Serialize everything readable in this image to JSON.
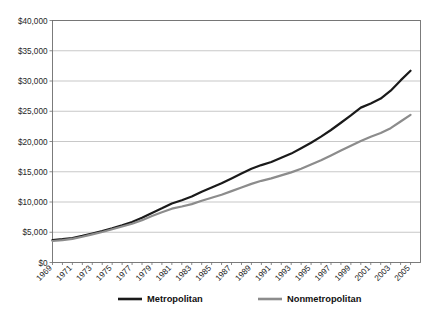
{
  "chart_data": {
    "type": "line",
    "title": "",
    "xlabel": "",
    "ylabel": "",
    "grid": true,
    "legend_position": "bottom",
    "ylim": [
      0,
      40000
    ],
    "yticks": [
      0,
      5000,
      10000,
      15000,
      20000,
      25000,
      30000,
      35000,
      40000
    ],
    "ytick_labels": [
      "$0",
      "$5,000",
      "$10,000",
      "$15,000",
      "$20,000",
      "$25,000",
      "$30,000",
      "$35,000",
      "$40,000"
    ],
    "xlim": [
      1969,
      2006
    ],
    "x": [
      1969,
      1970,
      1971,
      1972,
      1973,
      1974,
      1975,
      1976,
      1977,
      1978,
      1979,
      1980,
      1981,
      1982,
      1983,
      1984,
      1985,
      1986,
      1987,
      1988,
      1989,
      1990,
      1991,
      1992,
      1993,
      1994,
      1995,
      1996,
      1997,
      1998,
      1999,
      2000,
      2001,
      2002,
      2003,
      2004,
      2005
    ],
    "xtick_labels": [
      "1969",
      "1971",
      "1973",
      "1975",
      "1977",
      "1979",
      "1981",
      "1983",
      "1985",
      "1987",
      "1989",
      "1991",
      "1993",
      "1995",
      "1997",
      "1999",
      "2001",
      "2003",
      "2005"
    ],
    "series": [
      {
        "name": "Metropolitan",
        "color": "#1a1a1a",
        "values": [
          3700,
          3850,
          4050,
          4400,
          4800,
          5200,
          5650,
          6150,
          6700,
          7400,
          8200,
          8950,
          9750,
          10300,
          10900,
          11700,
          12400,
          13100,
          13900,
          14700,
          15500,
          16100,
          16600,
          17300,
          18000,
          18900,
          19800,
          20800,
          21900,
          23100,
          24300,
          25600,
          26300,
          27100,
          28400,
          30100,
          31700
        ]
      },
      {
        "name": "Nonmetropolitan",
        "color": "#8c8c8c",
        "values": [
          3550,
          3700,
          3900,
          4250,
          4650,
          5050,
          5500,
          5950,
          6400,
          7000,
          7700,
          8300,
          8900,
          9250,
          9650,
          10200,
          10700,
          11200,
          11800,
          12400,
          13000,
          13500,
          13900,
          14400,
          14900,
          15500,
          16200,
          16900,
          17700,
          18500,
          19300,
          20100,
          20800,
          21400,
          22200,
          23300,
          24400
        ]
      }
    ]
  },
  "legend": {
    "items": [
      {
        "label": "Metropolitan",
        "color": "#1a1a1a"
      },
      {
        "label": "Nonmetropolitan",
        "color": "#8c8c8c"
      }
    ]
  },
  "caption": {
    "text": ""
  }
}
